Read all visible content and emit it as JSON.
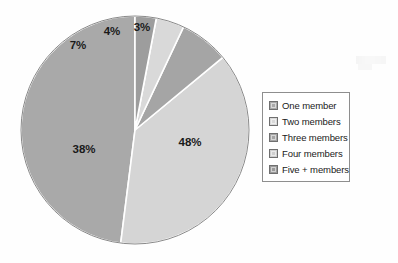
{
  "chart_data": {
    "type": "pie",
    "title": "",
    "subtitle": "",
    "xlabel": "",
    "ylabel": "",
    "grid": false,
    "legend_position": "right",
    "start_angle_deg": 0,
    "direction": "counterclockwise",
    "labels": [
      "One member",
      "Two members",
      "Three members",
      "Four members",
      "Five + members"
    ],
    "values": [
      48,
      38,
      7,
      4,
      3
    ],
    "value_suffix": "%",
    "data_labels": [
      "48%",
      "38%",
      "7%",
      "4%",
      "3%"
    ],
    "colors": [
      "#a9a9a9",
      "#d5d5d5",
      "#a5a5a5",
      "#d9d9d9",
      "#9d9d9d"
    ],
    "slices": [
      {
        "label": "One member",
        "value": 48,
        "data_label": "48%",
        "color": "#a9a9a9"
      },
      {
        "label": "Two members",
        "value": 38,
        "data_label": "38%",
        "color": "#d5d5d5"
      },
      {
        "label": "Three members",
        "value": 7,
        "data_label": "7%",
        "color": "#a5a5a5"
      },
      {
        "label": "Four members",
        "value": 4,
        "data_label": "4%",
        "color": "#d9d9d9"
      },
      {
        "label": "Five + members",
        "value": 3,
        "data_label": "3%",
        "color": "#9d9d9d"
      }
    ]
  },
  "legend": {
    "items": [
      {
        "label": "One member",
        "color": "#a9a9a9"
      },
      {
        "label": "Two members",
        "color": "#d9d9d9"
      },
      {
        "label": "Three members",
        "color": "#a5a5a5"
      },
      {
        "label": "Four members",
        "color": "#cfcfcf"
      },
      {
        "label": "Five + members",
        "color": "#9a9a9a"
      }
    ],
    "border_color": "#8e8e8e"
  },
  "geometry": {
    "center_x": 135,
    "center_y": 130,
    "radius": 114,
    "separator_color": "#ffffff",
    "outline_color": "#8a8a8a"
  },
  "label_positions": [
    {
      "text": "48%",
      "x": 190,
      "y": 143
    },
    {
      "text": "38%",
      "x": 84,
      "y": 150
    },
    {
      "text": "7%",
      "x": 78,
      "y": 46
    },
    {
      "text": "4%",
      "x": 112,
      "y": 32
    },
    {
      "text": "3%",
      "x": 142,
      "y": 28
    }
  ]
}
